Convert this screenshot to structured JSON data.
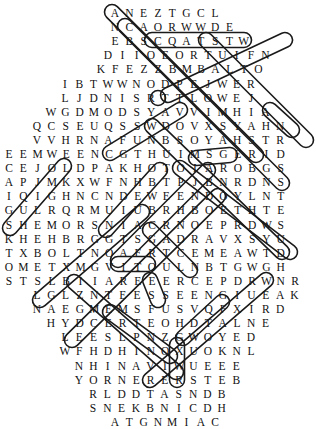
{
  "puzzle": {
    "type": "word-search",
    "cell_width": 14.3,
    "row_height": 14.1,
    "top": 6,
    "rows": [
      {
        "start": 112,
        "letters": "ANEZTGCL"
      },
      {
        "start": 112,
        "letters": "NCAORWWDE"
      },
      {
        "start": 112,
        "letters": "EBSCQATSTW"
      },
      {
        "start": 105,
        "letters": "DIIOEORTUIFN"
      },
      {
        "start": 98,
        "letters": "KFEZZBMBALTO"
      },
      {
        "start": 62,
        "letters": "IBTWWNODPEJWER"
      },
      {
        "start": 62,
        "letters": "LJDNISRTTLOWEJ"
      },
      {
        "start": 48,
        "letters": "WGDMODSYAVVIMHIA"
      },
      {
        "start": 34,
        "letters": "QCSEUQSSWDOVXSYAHN"
      },
      {
        "start": 34,
        "letters": "VVHRNAFUNBSOYAHSTR"
      },
      {
        "start": 6,
        "letters": "EEMWEENCGTHUIMSGERID"
      },
      {
        "start": 6,
        "letters": "CEJOLDPAKHOTOIAROBGS"
      },
      {
        "start": 6,
        "letters": "APJMKXWFNHBTPJBNRDNS"
      },
      {
        "start": 6,
        "letters": "IQIGHNCNDEWEENDOYLNT"
      },
      {
        "start": 6,
        "letters": "GULRQRMUIUBRHBOETHTE"
      },
      {
        "start": 6,
        "letters": "SHEMORSNIACRNOEPRDWS"
      },
      {
        "start": 6,
        "letters": "KHEHBRGGTSGADRAVXSYU"
      },
      {
        "start": 6,
        "letters": "TXBOLTNOAFRTCEMEAWTD"
      },
      {
        "start": 6,
        "letters": "OMETXMGVITOULNBTGWGH"
      },
      {
        "start": 6,
        "letters": "STSLBIIAREEERCEPDRWNR"
      },
      {
        "start": 34,
        "letters": "LGLZNTEESSEENGIUEAK"
      },
      {
        "start": 34,
        "letters": "NAEGMEMSFUSVQFXIRD"
      },
      {
        "start": 48,
        "letters": "HYDCERTEOHDTALNE"
      },
      {
        "start": 62,
        "letters": "LEESLPNZGWOYED"
      },
      {
        "start": 62,
        "letters": "WFHDHINOXUOKNL"
      },
      {
        "start": 76,
        "letters": "NHINAVIWUEEE"
      },
      {
        "start": 76,
        "letters": "YORNERERSTEB"
      },
      {
        "start": 90,
        "letters": "RLDDTASNDB"
      },
      {
        "start": 90,
        "letters": "SNEKBNICDH"
      },
      {
        "start": 112,
        "letters": "ATGNMIAC"
      }
    ],
    "loops": [
      {
        "name": "diag-1",
        "x1": 112,
        "y1": 12,
        "x2": 256,
        "y2": 155
      },
      {
        "name": "diag-2",
        "x1": 125,
        "y1": 26,
        "x2": 282,
        "y2": 183
      },
      {
        "name": "diag-3",
        "x1": 206,
        "y1": 40,
        "x2": 306,
        "y2": 140
      },
      {
        "name": "diag-4",
        "x1": 152,
        "y1": 40,
        "x2": 244,
        "y2": 40
      },
      {
        "name": "v-1",
        "x1": 158,
        "y1": 98,
        "x2": 158,
        "y2": 98
      },
      {
        "name": "diag-5",
        "x1": 285,
        "y1": 40,
        "x2": 168,
        "y2": 95
      },
      {
        "name": "diag-6",
        "x1": 152,
        "y1": 126,
        "x2": 282,
        "y2": 252
      },
      {
        "name": "diag-7",
        "x1": 180,
        "y1": 110,
        "x2": 110,
        "y2": 153
      },
      {
        "name": "diag-8",
        "x1": 270,
        "y1": 110,
        "x2": 292,
        "y2": 130
      },
      {
        "name": "diag-9",
        "x1": 180,
        "y1": 168,
        "x2": 290,
        "y2": 252
      },
      {
        "name": "diag-10",
        "x1": 196,
        "y1": 158,
        "x2": 230,
        "y2": 155
      },
      {
        "name": "diag-11",
        "x1": 64,
        "y1": 166,
        "x2": 10,
        "y2": 228
      },
      {
        "name": "diag-12",
        "x1": 160,
        "y1": 170,
        "x2": 106,
        "y2": 230
      },
      {
        "name": "diag-13",
        "x1": 208,
        "y1": 170,
        "x2": 118,
        "y2": 260
      },
      {
        "name": "diag-14",
        "x1": 218,
        "y1": 196,
        "x2": 72,
        "y2": 340
      },
      {
        "name": "diag-15",
        "x1": 142,
        "y1": 212,
        "x2": 40,
        "y2": 300
      },
      {
        "name": "diag-16",
        "x1": 150,
        "y1": 230,
        "x2": 190,
        "y2": 270
      },
      {
        "name": "diag-17",
        "x1": 118,
        "y1": 264,
        "x2": 148,
        "y2": 264
      },
      {
        "name": "diag-18",
        "x1": 150,
        "y1": 280,
        "x2": 158,
        "y2": 300
      },
      {
        "name": "diag-19",
        "x1": 266,
        "y1": 280,
        "x2": 150,
        "y2": 380
      },
      {
        "name": "diag-20",
        "x1": 74,
        "y1": 282,
        "x2": 176,
        "y2": 372
      },
      {
        "name": "diag-21",
        "x1": 110,
        "y1": 312,
        "x2": 170,
        "y2": 356
      },
      {
        "name": "diag-22",
        "x1": 222,
        "y1": 302,
        "x2": 183,
        "y2": 338
      },
      {
        "name": "v-2",
        "x1": 177,
        "y1": 345,
        "x2": 177,
        "y2": 380
      }
    ]
  }
}
